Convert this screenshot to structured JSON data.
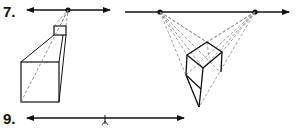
{
  "exercises": [
    {
      "number_label": "7.",
      "type": "one-point perspective",
      "horizon": {
        "y": 10,
        "x1": 25,
        "x2": 112
      },
      "vanishing_points": [
        {
          "x": 68,
          "y": 10
        }
      ]
    },
    {
      "number_label": "",
      "type": "two-point perspective",
      "horizon": {
        "y": 12,
        "x1": 125,
        "x2": 290
      },
      "vanishing_points": [
        {
          "x": 160,
          "y": 12
        },
        {
          "x": 255,
          "y": 12
        }
      ]
    },
    {
      "number_label": "9.",
      "type": "horizon line",
      "horizon": {
        "y": 118,
        "x1": 25,
        "x2": 185
      },
      "tick_x": 105
    }
  ],
  "colors": {
    "ink": "#111111",
    "guide": "#888888",
    "background": "#ffffff"
  }
}
